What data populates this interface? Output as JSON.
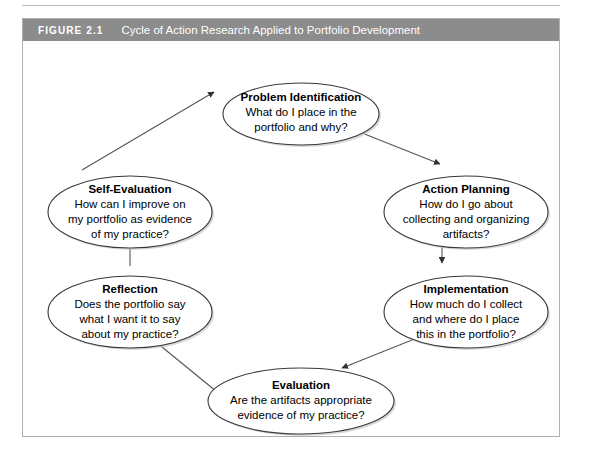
{
  "figure": {
    "label": "FIGURE 2.1",
    "caption": "Cycle of Action Research Applied to Portfolio Development",
    "header_bg": "#8c8c8c",
    "header_text_color": "#ffffff",
    "border_color": "#b0b0b0",
    "background": "#ffffff"
  },
  "diagram": {
    "type": "cycle",
    "direction": "clockwise",
    "node_shape": "ellipse",
    "node_fill": "#ffffff",
    "node_stroke": "#3a3a3a",
    "connector_color": "#555555",
    "nodes": [
      {
        "id": "problem-identification",
        "title": "Problem Identification",
        "lines": [
          "What do I place in the",
          "portfolio and why?"
        ],
        "position": "top"
      },
      {
        "id": "action-planning",
        "title": "Action Planning",
        "lines": [
          "How do I go about",
          "collecting and organizing",
          "artifacts?"
        ],
        "position": "top-right"
      },
      {
        "id": "implementation",
        "title": "Implementation",
        "lines": [
          "How much do I collect",
          "and where do I place",
          "this in the portfolio?"
        ],
        "position": "bottom-right"
      },
      {
        "id": "evaluation",
        "title": "Evaluation",
        "lines": [
          "Are the artifacts appropriate",
          "evidence of my practice?"
        ],
        "position": "bottom"
      },
      {
        "id": "reflection",
        "title": "Reflection",
        "lines": [
          "Does the portfolio say",
          "what I want it to say",
          "about my practice?"
        ],
        "position": "bottom-left"
      },
      {
        "id": "self-evaluation",
        "title": "Self-Evaluation",
        "lines": [
          "How can I improve on",
          "my portfolio as evidence",
          "of my practice?"
        ],
        "position": "top-left"
      }
    ],
    "edges": [
      {
        "from": "problem-identification",
        "to": "action-planning"
      },
      {
        "from": "action-planning",
        "to": "implementation"
      },
      {
        "from": "implementation",
        "to": "evaluation"
      },
      {
        "from": "evaluation",
        "to": "reflection"
      },
      {
        "from": "reflection",
        "to": "self-evaluation"
      },
      {
        "from": "self-evaluation",
        "to": "problem-identification"
      }
    ]
  }
}
